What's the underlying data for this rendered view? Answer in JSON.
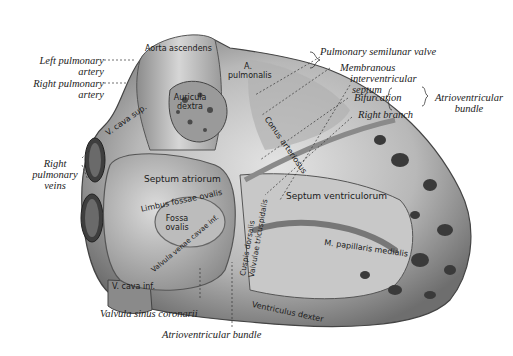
{
  "figure": {
    "external_labels": {
      "left_pulmonary_artery": [
        "Left pulmonary",
        "artery"
      ],
      "right_pulmonary_artery": [
        "Right pulmonary",
        "artery"
      ],
      "right_pulmonary_veins": [
        "Right",
        "pulmonary",
        "veins"
      ],
      "pulmonary_semilunar_valve": "Pulmonary semilunar valve",
      "membranous_interventricular_septum": [
        "Membranous",
        "interventricular",
        "septum"
      ],
      "bifurcation": "Bifurcation",
      "right_branch": "Right branch",
      "atrioventricular_bundle_group": [
        "Atrioventricular",
        "bundle"
      ],
      "valvula_sinus_coronarii": "Valvula sinus coronarii",
      "atrioventricular_bundle_bottom": "Atrioventricular bundle"
    },
    "internal_labels": {
      "aorta_ascendens": "Aorta ascendens",
      "a_pulmonalis": [
        "A.",
        "pulmonalis"
      ],
      "auricula_dextra": [
        "Auricula",
        "dextra"
      ],
      "v_cava_superior": "V. cava sup.",
      "septum_atriorum": "Septum atriorum",
      "limbus_fossae_ovalis": "Limbus fossae ovalis",
      "fossa_ovalis": [
        "Fossa",
        "ovalis"
      ],
      "valvula_venae_cavae": "Valvula venae cavae inf.",
      "v_cava_inferior": "V. cava inf.",
      "conus_arteriosus": "Conus arteriosus",
      "septum_ventriculorum": "Septum ventriculorum",
      "m_papillaris_medialis": "M. papillaris medialis",
      "cuspis_dorsalis": [
        "Cuspis dorsalis",
        "Valvulae tricuspidalis"
      ],
      "ventriculus_dexter": "Ventriculus dexter"
    },
    "colors": {
      "background": "#ffffff",
      "tissue_light": "#d9d9d9",
      "tissue_mid": "#a8a8a8",
      "tissue_dark": "#5a5a5a",
      "ink": "#222222"
    }
  }
}
